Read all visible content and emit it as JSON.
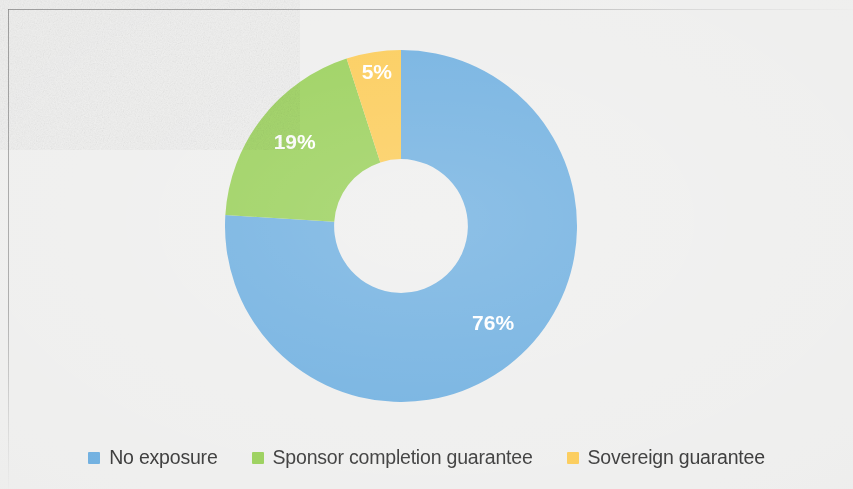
{
  "chart_data": {
    "type": "pie",
    "variant": "donut",
    "title": "",
    "subtitle": "",
    "xlabel": "",
    "ylabel": "",
    "legend_position": "bottom",
    "grid": false,
    "value_unit": "%",
    "hole_ratio": 0.38,
    "start_angle_deg": 0,
    "direction": "clockwise",
    "categories": [
      "No exposure",
      "Sponsor completion guarantee",
      "Sovereign guarantee"
    ],
    "values": [
      76,
      19,
      5
    ],
    "labels": [
      "76%",
      "19%",
      "5%"
    ],
    "colors": [
      "#62A8DD",
      "#8FCB49",
      "#FBC646"
    ],
    "series": [
      {
        "name": "Credit enhancement exposure",
        "values": [
          76,
          19,
          5
        ]
      }
    ],
    "slices": [
      {
        "name": "No exposure",
        "value": 76,
        "label": "76%",
        "color": "#62A8DD",
        "start_angle_deg": 0,
        "end_angle_deg": 273.6
      },
      {
        "name": "Sponsor completion guarantee",
        "value": 19,
        "label": "19%",
        "color": "#8FCB49",
        "start_angle_deg": 273.6,
        "end_angle_deg": 342.0
      },
      {
        "name": "Sovereign guarantee",
        "value": 5,
        "label": "5%",
        "color": "#FBC646",
        "start_angle_deg": 342.0,
        "end_angle_deg": 360.0
      }
    ]
  },
  "legend": {
    "items": [
      {
        "label": "No exposure",
        "color": "#62A8DD"
      },
      {
        "label": "Sponsor completion guarantee",
        "color": "#8FCB49"
      },
      {
        "label": "Sovereign guarantee",
        "color": "#FBC646"
      }
    ]
  },
  "style": {
    "background": "#ededec",
    "hole_color": "#ededec",
    "label_color": "#ffffff",
    "legend_text_color": "#262626",
    "frame_rule_color": "#7d7d7d"
  }
}
